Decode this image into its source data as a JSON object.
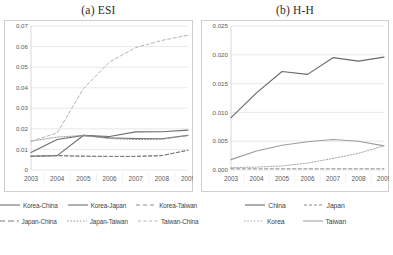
{
  "figure": {
    "panels": [
      {
        "title": "(a) ESI",
        "axis": {
          "y_ticks": [
            "0.07",
            "0.06",
            "0.05",
            "0.04",
            "0.03",
            "0.02",
            "0.01",
            "0"
          ],
          "y_min": 0,
          "y_max": 0.07,
          "x_ticks": [
            "2003",
            "2004",
            "2005",
            "2006",
            "2007",
            "2008",
            "2009"
          ]
        },
        "legend": [
          {
            "label": "Korea-China",
            "style": "solid",
            "color": "#6f6f6f"
          },
          {
            "label": "Korea-Japan",
            "style": "solid",
            "color": "#6f6f6f"
          },
          {
            "label": "Korea-Taiwan",
            "style": "dashed",
            "color": "#8e8e8e"
          },
          {
            "label": "Japan-China",
            "style": "dashed",
            "color": "#7c7c7c"
          },
          {
            "label": "Japan-Taiwan",
            "style": "dotted",
            "color": "#9a9a9a"
          },
          {
            "label": "Taiwan-China",
            "style": "dashed",
            "color": "#b4b4b4"
          }
        ]
      },
      {
        "title": "(b) H-H",
        "axis": {
          "y_ticks": [
            "0.025",
            "0.020",
            "0.015",
            "0.010",
            "0.005",
            "0.000"
          ],
          "y_min": 0,
          "y_max": 0.025,
          "x_ticks": [
            "2003",
            "2004",
            "2005",
            "2006",
            "2007",
            "2008",
            "2009"
          ]
        },
        "legend": [
          {
            "label": "China",
            "style": "solid",
            "color": "#6a6a6a"
          },
          {
            "label": "Japan",
            "style": "dashed",
            "color": "#8a8a8a"
          },
          {
            "label": "Korea",
            "style": "dotted",
            "color": "#a8a8a8"
          },
          {
            "label": "Taiwan",
            "style": "solid",
            "color": "#9c9c9c"
          }
        ]
      }
    ]
  },
  "chart_data": [
    {
      "type": "line",
      "title": "(a) ESI",
      "xlabel": "",
      "ylabel": "",
      "x": [
        2003,
        2004,
        2005,
        2006,
        2007,
        2008,
        2009
      ],
      "xtick_labels": [
        "2003",
        "2004",
        "2005",
        "2006",
        "2007",
        "2008",
        "2009"
      ],
      "ytick_labels": [
        "0",
        "0.01",
        "0.02",
        "0.03",
        "0.04",
        "0.05",
        "0.06",
        "0.07"
      ],
      "ylim": [
        0,
        0.07
      ],
      "grid": "horizontal",
      "legend_position": "below",
      "series": [
        {
          "name": "Korea-China",
          "style": "solid",
          "values": [
            0.0085,
            0.0148,
            0.0168,
            0.0163,
            0.0185,
            0.0186,
            0.0194
          ]
        },
        {
          "name": "Korea-Japan",
          "style": "solid",
          "values": [
            0.0067,
            0.007,
            0.0168,
            0.0156,
            0.0153,
            0.0152,
            0.0168
          ]
        },
        {
          "name": "Korea-Taiwan",
          "style": "dashed",
          "values": [
            0.0067,
            0.007,
            0.0067,
            0.0066,
            0.0066,
            0.007,
            0.0096
          ]
        },
        {
          "name": "Japan-China",
          "style": "dashed",
          "values": [
            0.0067,
            0.007,
            0.0067,
            0.0066,
            0.0066,
            0.007,
            0.0096
          ]
        },
        {
          "name": "Japan-Taiwan",
          "style": "dotted",
          "values": [
            0.014,
            0.016,
            0.0168,
            0.0153,
            0.0148,
            0.0149,
            0.0168
          ]
        },
        {
          "name": "Taiwan-China",
          "style": "dashed",
          "values": [
            0.014,
            0.018,
            0.0395,
            0.0525,
            0.0595,
            0.063,
            0.0655
          ]
        }
      ]
    },
    {
      "type": "line",
      "title": "(b) H-H",
      "xlabel": "",
      "ylabel": "",
      "x": [
        2003,
        2004,
        2005,
        2006,
        2007,
        2008,
        2009
      ],
      "xtick_labels": [
        "2003",
        "2004",
        "2005",
        "2006",
        "2007",
        "2008",
        "2009"
      ],
      "ytick_labels": [
        "0.000",
        "0.005",
        "0.010",
        "0.015",
        "0.020",
        "0.025"
      ],
      "ylim": [
        0,
        0.025
      ],
      "grid": "horizontal",
      "legend_position": "below",
      "series": [
        {
          "name": "China",
          "style": "solid",
          "values": [
            0.0091,
            0.0134,
            0.0171,
            0.0166,
            0.0195,
            0.0189,
            0.0196
          ]
        },
        {
          "name": "Japan",
          "style": "dashed",
          "values": [
            0.0002,
            0.0002,
            0.0002,
            0.0002,
            0.0002,
            0.0002,
            0.0002
          ]
        },
        {
          "name": "Korea",
          "style": "dotted",
          "values": [
            0.0004,
            0.0005,
            0.0007,
            0.0012,
            0.002,
            0.0029,
            0.0042
          ]
        },
        {
          "name": "Taiwan",
          "style": "solid",
          "values": [
            0.0018,
            0.0033,
            0.0043,
            0.0049,
            0.0053,
            0.005,
            0.0042
          ]
        }
      ]
    }
  ]
}
